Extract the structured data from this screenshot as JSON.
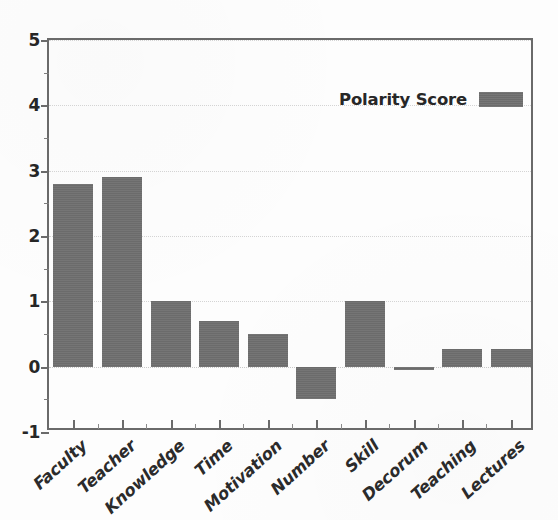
{
  "chart_data": {
    "type": "bar",
    "title": "",
    "xlabel": "",
    "ylabel": "",
    "ylim": [
      -1,
      5
    ],
    "yticks": [
      "-1",
      "0",
      "1",
      "2",
      "3",
      "4",
      "5"
    ],
    "grid": true,
    "legend_position": "top-right",
    "series_name": "Polarity Score",
    "bar_color": "#6e6e6e",
    "categories": [
      "Faculty",
      "Teacher",
      "Knowledge",
      "Time",
      "Motivation",
      "Number",
      "Skill",
      "Decorum",
      "Teaching",
      "Lectures"
    ],
    "values": [
      2.8,
      2.9,
      1.0,
      0.7,
      0.5,
      -0.5,
      1.0,
      -0.03,
      0.27,
      0.27
    ]
  },
  "legend": {
    "label": "Polarity Score"
  },
  "axis": {
    "y_labels": [
      "5",
      "4",
      "3",
      "2",
      "1",
      "0",
      "-1"
    ]
  }
}
